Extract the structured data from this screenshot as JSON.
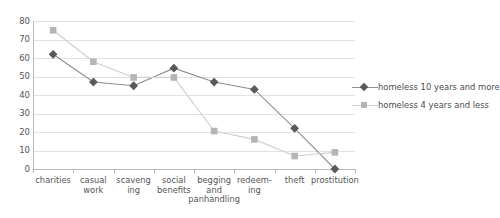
{
  "chart_data": {
    "type": "line",
    "title": "",
    "xlabel": "",
    "ylabel": "",
    "ylim": [
      0,
      80
    ],
    "ytick_step": 10,
    "yticks": [
      80,
      70,
      60,
      50,
      40,
      30,
      20,
      10,
      0
    ],
    "grid": true,
    "legend_position": "right",
    "categories": [
      "charities",
      "casual\nwork",
      "scaveng\ning",
      "social\nbenefits",
      "begging\nand\npanhandling",
      "redeem-\ning",
      "theft",
      "prostitution"
    ],
    "series": [
      {
        "name": "homeless 10 years and more",
        "marker": "diamond",
        "color": "#5a5a5a",
        "line_color": "#8e8e8e",
        "values": [
          62,
          47,
          45,
          54.5,
          47,
          43,
          22,
          0
        ]
      },
      {
        "name": "homeless 4 years and less",
        "marker": "square",
        "color": "#b5b5b5",
        "line_color": "#cfcfcf",
        "values": [
          75,
          58,
          49.5,
          49.5,
          20.5,
          16,
          7,
          9
        ]
      }
    ]
  },
  "colors": {
    "gridline": "#e2e2e2",
    "axis": "#b9b9b9",
    "text": "#4a4a4a",
    "background": "#ffffff"
  }
}
